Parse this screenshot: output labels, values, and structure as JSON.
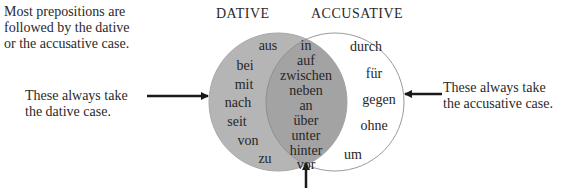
{
  "intro_text": "Most prepositions are\nfollowed by the dative\nor the accusative case.",
  "headings": {
    "dative": "DATIVE",
    "accusative": "ACCUSATIVE"
  },
  "annotations": {
    "dative_only": "These always take\nthe dative case.",
    "accusative_only": "These always take\nthe accusative case."
  },
  "colors": {
    "dative_fill": "#b5b5b5",
    "overlap_fill": "#a3a3a3",
    "accusative_fill": "#ffffff",
    "outline": "#9a9a9a",
    "arrow": "#1a1a1a"
  },
  "dative_only": [
    "aus",
    "bei",
    "mit",
    "nach",
    "seit",
    "von",
    "zu"
  ],
  "both": [
    "in",
    "auf",
    "zwischen",
    "neben",
    "an",
    "über",
    "unter",
    "hinter",
    "vor"
  ],
  "accusative_only": [
    "durch",
    "für",
    "gegen",
    "ohne",
    "um"
  ]
}
